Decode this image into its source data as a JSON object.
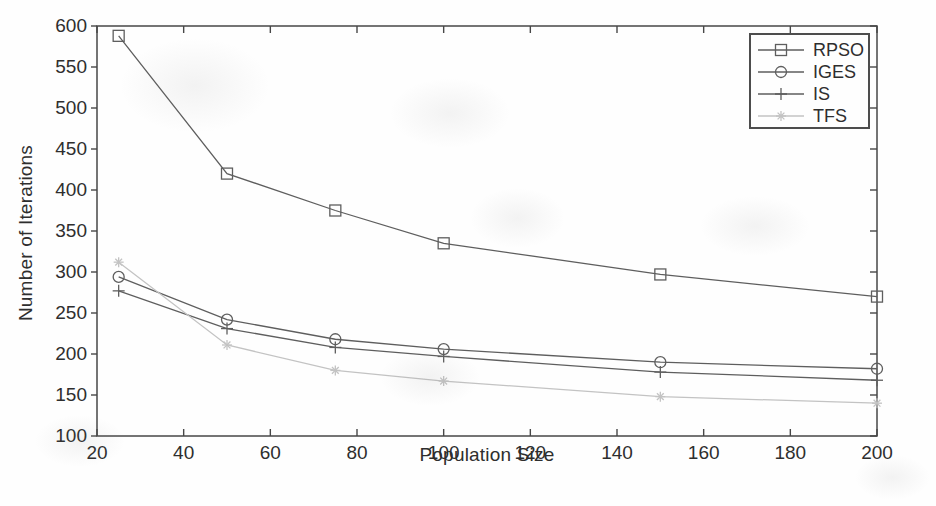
{
  "chart_data": {
    "type": "line",
    "title": "",
    "xlabel": "Population Size",
    "ylabel": "Number of Iterations",
    "xlim": [
      20,
      200
    ],
    "ylim": [
      100,
      600
    ],
    "xticks": [
      20,
      40,
      60,
      80,
      100,
      120,
      140,
      160,
      180,
      200
    ],
    "yticks": [
      100,
      150,
      200,
      250,
      300,
      350,
      400,
      450,
      500,
      550,
      600
    ],
    "grid": false,
    "legend_position": "top-right",
    "x": [
      25,
      50,
      75,
      100,
      150,
      200
    ],
    "series": [
      {
        "name": "RPSO",
        "marker": "square",
        "color": "#5e5e5e",
        "values": [
          588,
          420,
          375,
          335,
          297,
          270
        ]
      },
      {
        "name": "IGES",
        "marker": "circle",
        "color": "#5e5e5e",
        "values": [
          294,
          242,
          218,
          206,
          190,
          182
        ]
      },
      {
        "name": "IS",
        "marker": "plus",
        "color": "#5e5e5e",
        "values": [
          277,
          231,
          208,
          197,
          178,
          168
        ]
      },
      {
        "name": "TFS",
        "marker": "star",
        "color": "#c3c3c3",
        "values": [
          312,
          211,
          180,
          167,
          148,
          140
        ]
      }
    ],
    "colors": {
      "axis": "#474747",
      "text": "#2e2e2e",
      "background": "#fefefe"
    }
  }
}
